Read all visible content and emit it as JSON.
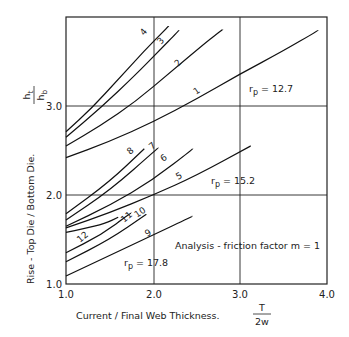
{
  "chart_data": {
    "type": "line",
    "title": "",
    "xlabel": "Current / Final Web Thickness.",
    "xlabel_symbol": {
      "numerator": "T",
      "denominator": "2w"
    },
    "ylabel": "Rise - Top Die / Bottom Die.",
    "ylabel_symbol": {
      "numerator": "h_t",
      "denominator": "h_b"
    },
    "xlim": [
      1.0,
      4.0
    ],
    "ylim": [
      1.0,
      4.0
    ],
    "xticks": [
      "1.0",
      "2.0",
      "3.0",
      "4.0"
    ],
    "yticks": [
      "1.0",
      "2.0",
      "3.0"
    ],
    "grid": {
      "vertical": [
        2.0,
        3.0
      ],
      "horizontal": [
        2.0,
        3.0
      ]
    },
    "annotations": [
      {
        "text": "r_p = 12.7",
        "x": 3.05,
        "y": 3.15
      },
      {
        "text": "r_p = 15.2",
        "x": 2.35,
        "y": 1.82
      },
      {
        "text": "r_p = 17.8",
        "x": 1.55,
        "y": 1.22
      },
      {
        "text": "Analysis - friction factor m = 1",
        "x": 2.6,
        "y": 1.48
      }
    ],
    "series": [
      {
        "name": "4",
        "group": "r_p = 12.7",
        "points": [
          [
            1.0,
            2.71
          ],
          [
            1.3,
            2.98
          ],
          [
            1.6,
            3.3
          ],
          [
            1.9,
            3.62
          ],
          [
            2.18,
            3.9
          ]
        ]
      },
      {
        "name": "3",
        "group": "r_p = 12.7",
        "points": [
          [
            1.0,
            2.65
          ],
          [
            1.4,
            2.98
          ],
          [
            1.8,
            3.35
          ],
          [
            2.05,
            3.6
          ],
          [
            2.3,
            3.85
          ]
        ]
      },
      {
        "name": "2",
        "group": "r_p = 12.7",
        "points": [
          [
            1.0,
            2.55
          ],
          [
            1.4,
            2.78
          ],
          [
            1.8,
            3.05
          ],
          [
            2.2,
            3.38
          ],
          [
            2.65,
            3.75
          ],
          [
            2.8,
            3.86
          ]
        ]
      },
      {
        "name": "1",
        "group": "r_p = 12.7",
        "points": [
          [
            1.0,
            2.42
          ],
          [
            1.5,
            2.6
          ],
          [
            2.0,
            2.82
          ],
          [
            2.5,
            3.08
          ],
          [
            3.0,
            3.36
          ],
          [
            3.5,
            3.62
          ],
          [
            3.9,
            3.85
          ]
        ]
      },
      {
        "name": "8",
        "group": "r_p = 15.2",
        "points": [
          [
            1.0,
            1.79
          ],
          [
            1.5,
            2.15
          ],
          [
            1.9,
            2.52
          ]
        ]
      },
      {
        "name": "7",
        "group": "r_p = 15.2",
        "points": [
          [
            1.0,
            1.72
          ],
          [
            1.5,
            2.05
          ],
          [
            2.06,
            2.53
          ]
        ]
      },
      {
        "name": "6",
        "group": "r_p = 15.2",
        "points": [
          [
            1.0,
            1.65
          ],
          [
            1.5,
            1.88
          ],
          [
            2.0,
            2.17
          ],
          [
            2.46,
            2.52
          ]
        ]
      },
      {
        "name": "5",
        "group": "r_p = 15.2",
        "points": [
          [
            1.0,
            1.63
          ],
          [
            1.5,
            1.8
          ],
          [
            2.0,
            2.0
          ],
          [
            2.5,
            2.22
          ],
          [
            3.12,
            2.55
          ]
        ]
      },
      {
        "name": "12",
        "group": "r_p = 17.8",
        "points": [
          [
            1.0,
            1.58
          ],
          [
            1.2,
            1.62
          ],
          [
            1.45,
            1.68
          ],
          [
            1.6,
            1.75
          ]
        ]
      },
      {
        "name": "11",
        "group": "r_p = 17.8",
        "points": [
          [
            1.0,
            1.35
          ],
          [
            1.4,
            1.55
          ],
          [
            1.75,
            1.8
          ]
        ]
      },
      {
        "name": "10",
        "group": "r_p = 17.8",
        "points": [
          [
            1.0,
            1.25
          ],
          [
            1.5,
            1.5
          ],
          [
            1.92,
            1.78
          ]
        ]
      },
      {
        "name": "9",
        "group": "r_p = 17.8",
        "points": [
          [
            1.0,
            1.09
          ],
          [
            1.5,
            1.32
          ],
          [
            2.0,
            1.55
          ],
          [
            2.45,
            1.76
          ]
        ]
      }
    ]
  },
  "labels": {
    "ylabel": "Rise - Top Die / Bottom Die.",
    "ylabel_num": "h",
    "ylabel_num_sub": "t",
    "ylabel_den": "h",
    "ylabel_den_sub": "b",
    "xlabel": "Current / Final Web Thickness.",
    "xlabel_num": "T",
    "xlabel_den": "2w",
    "rp1": "r",
    "rp1_sub": "p",
    "rp1_val": " = 12.7",
    "rp2": "r",
    "rp2_sub": "p",
    "rp2_val": " = 15.2",
    "rp3": "r",
    "rp3_sub": "p",
    "rp3_val": " = 17.8",
    "analysis": "Analysis - friction factor m = 1",
    "xtick_1": "1.0",
    "xtick_2": "2.0",
    "xtick_3": "3.0",
    "xtick_4": "4.0",
    "ytick_1": "1.0",
    "ytick_2": "2.0",
    "ytick_3": "3.0",
    "c1": "1",
    "c2": "2",
    "c3": "3",
    "c4": "4",
    "c5": "5",
    "c6": "6",
    "c7": "7",
    "c8": "8",
    "c9": "9",
    "c10": "10",
    "c11": "11",
    "c12": "12"
  }
}
